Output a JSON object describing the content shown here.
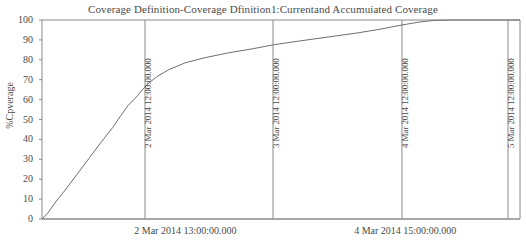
{
  "chart_data": {
    "type": "line",
    "title": "Coverage Definition-Coverage Dfinition1:Currentand Accumuiated Coverage",
    "xlabel": "",
    "ylabel": "%Cpverage",
    "ylim": [
      0,
      100
    ],
    "y_ticks": [
      "100",
      "90",
      "80",
      "70",
      "60",
      "50",
      "40",
      "30",
      "20",
      "10",
      "0"
    ],
    "y_tick_values": [
      100,
      90,
      80,
      70,
      60,
      50,
      40,
      30,
      20,
      10,
      0
    ],
    "grid": false,
    "legend": "none",
    "line_color": "#6e6e6e",
    "axis_color": "#8a8a8a",
    "x_axis_labels": [
      "2 Mar 2014 13:00:00.000",
      "4 Mar 2014 15:00:00.000"
    ],
    "vertical_gridlines": [
      {
        "label": "2 Mar 2014 12:00:00.000",
        "x_frac": 0.2155
      },
      {
        "label": "3 Mar 2014 12:00:00.000",
        "x_frac": 0.4833
      },
      {
        "label": "4 Mar 2014 12:00:00.000",
        "x_frac": 0.7531
      },
      {
        "label": "5 Mar 2014 12:00:00.000",
        "x_frac": 0.9749
      }
    ],
    "series": [
      {
        "name": "Accumulated Coverage",
        "points": [
          [
            0.0,
            0.0
          ],
          [
            0.012,
            3.0
          ],
          [
            0.03,
            9.0
          ],
          [
            0.05,
            15.0
          ],
          [
            0.075,
            23.0
          ],
          [
            0.1,
            31.0
          ],
          [
            0.125,
            39.0
          ],
          [
            0.148,
            46.0
          ],
          [
            0.165,
            52.0
          ],
          [
            0.18,
            57.0
          ],
          [
            0.192,
            60.0
          ],
          [
            0.2,
            62.0
          ],
          [
            0.21,
            65.0
          ],
          [
            0.222,
            68.0
          ],
          [
            0.24,
            71.5
          ],
          [
            0.265,
            75.0
          ],
          [
            0.3,
            78.5
          ],
          [
            0.34,
            81.0
          ],
          [
            0.39,
            83.5
          ],
          [
            0.44,
            85.5
          ],
          [
            0.483,
            87.5
          ],
          [
            0.54,
            89.5
          ],
          [
            0.6,
            91.5
          ],
          [
            0.66,
            93.5
          ],
          [
            0.71,
            95.5
          ],
          [
            0.753,
            97.5
          ],
          [
            0.79,
            99.0
          ],
          [
            0.82,
            99.8
          ],
          [
            0.86,
            100.0
          ],
          [
            0.93,
            100.0
          ],
          [
            1.0,
            100.0
          ]
        ]
      }
    ]
  }
}
